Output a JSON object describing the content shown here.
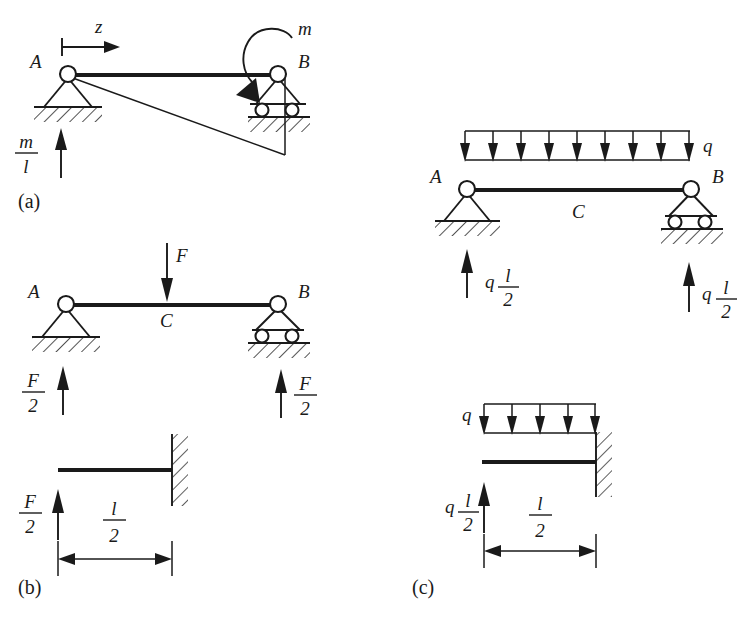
{
  "figure": {
    "panels": [
      {
        "id": "a",
        "label": "(a)",
        "description": "Simply supported beam A-B with applied concentrated moment m at B and its influence line",
        "axis_label": "z",
        "moment_label": "m",
        "node_left": "A",
        "node_right": "B",
        "reaction_left_num": "m",
        "reaction_left_den": "l",
        "support_left_type": "pin",
        "support_right_type": "roller"
      },
      {
        "id": "b",
        "label": "(b)",
        "description": "Simply supported beam A-B with point load F at midspan C, and cantilever free body",
        "load_label": "F",
        "node_left": "A",
        "node_right": "B",
        "node_mid": "C",
        "reaction_left_num": "F",
        "reaction_left_den": "2",
        "reaction_right_num": "F",
        "reaction_right_den": "2",
        "cantilever_reaction_num": "F",
        "cantilever_reaction_den": "2",
        "dimension_num": "l",
        "dimension_den": "2",
        "support_left_type": "pin",
        "support_right_type": "roller",
        "support_wall_type": "fixed"
      },
      {
        "id": "c",
        "label": "(c)",
        "description": "Simply supported beam A-B with uniformly distributed load q, and cantilever free body",
        "load_label": "q",
        "node_left": "A",
        "node_right": "B",
        "node_mid": "C",
        "udl_arrow_count_top": 9,
        "udl_arrow_count_bottom": 5,
        "reaction_left_coef": "q",
        "reaction_left_num": "l",
        "reaction_left_den": "2",
        "reaction_right_coef": "q",
        "reaction_right_num": "l",
        "reaction_right_den": "2",
        "cantilever_reaction_coef": "q",
        "cantilever_reaction_num": "l",
        "cantilever_reaction_den": "2",
        "cantilever_load_label": "q",
        "dimension_num": "l",
        "dimension_den": "2",
        "support_left_type": "pin",
        "support_right_type": "roller",
        "support_wall_type": "fixed"
      }
    ],
    "colors": {
      "ink": "#1a1a1a",
      "paper": "#ffffff"
    }
  }
}
